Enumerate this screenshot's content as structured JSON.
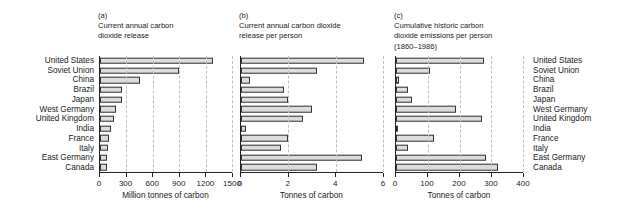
{
  "countries": [
    "United States",
    "Soviet Union",
    "China",
    "Brazil",
    "Japan",
    "West Germany",
    "United Kingdom",
    "India",
    "France",
    "Italy",
    "East Germany",
    "Canada"
  ],
  "labels_left_name": "country-labels-left",
  "labels_right_name": "country-labels-right",
  "panels": [
    {
      "tag": "(a)",
      "title": "Current annual carbon\ndioxide release",
      "axis_title": "Million tonnes of carbon",
      "ticks": [
        0,
        300,
        600,
        900,
        1200,
        1500
      ],
      "tick_labels": [
        "0",
        "300",
        "600",
        "900",
        "1200",
        "1500"
      ]
    },
    {
      "tag": "(b)",
      "title": "Current annual carbon dioxide\nrelease per person",
      "axis_title": "Tonnes of carbon",
      "ticks": [
        0,
        2,
        4,
        6
      ],
      "tick_labels": [
        "0",
        "2",
        "4",
        "6"
      ]
    },
    {
      "tag": "(c)",
      "title": "Cumulative historic carbon\ndioxide emissions per person\n(1860–1986)",
      "axis_title": "Tonnes of carbon",
      "ticks": [
        0,
        100,
        200,
        300,
        400
      ],
      "tick_labels": [
        "0",
        "100",
        "200",
        "300",
        "400"
      ]
    }
  ],
  "chart_data": [
    {
      "type": "bar",
      "orientation": "horizontal",
      "panel": "(a)",
      "title": "Current annual carbon dioxide release",
      "xlabel": "Million tonnes of carbon",
      "ylabel": "",
      "xlim": [
        0,
        1500
      ],
      "xticks": [
        0,
        300,
        600,
        900,
        1200,
        1500
      ],
      "grid": "vertical-dashed",
      "legend": "none",
      "categories": [
        "United States",
        "Soviet Union",
        "China",
        "Brazil",
        "Japan",
        "West Germany",
        "United Kingdom",
        "India",
        "France",
        "Italy",
        "East Germany",
        "Canada"
      ],
      "values": [
        1280,
        900,
        450,
        250,
        250,
        185,
        155,
        125,
        100,
        95,
        85,
        85
      ]
    },
    {
      "type": "bar",
      "orientation": "horizontal",
      "panel": "(b)",
      "title": "Current annual carbon dioxide release per person",
      "xlabel": "Tonnes of carbon",
      "ylabel": "",
      "xlim": [
        0,
        6
      ],
      "xticks": [
        0,
        2,
        4,
        6
      ],
      "grid": "vertical-dashed",
      "legend": "none",
      "categories": [
        "United States",
        "Soviet Union",
        "China",
        "Brazil",
        "Japan",
        "West Germany",
        "United Kingdom",
        "India",
        "France",
        "Italy",
        "East Germany",
        "Canada"
      ],
      "values": [
        5.2,
        3.2,
        0.4,
        1.8,
        2.0,
        3.0,
        2.6,
        0.2,
        2.0,
        1.7,
        5.1,
        3.2
      ]
    },
    {
      "type": "bar",
      "orientation": "horizontal",
      "panel": "(c)",
      "title": "Cumulative historic carbon dioxide emissions per person (1860–1986)",
      "xlabel": "Tonnes of carbon",
      "ylabel": "",
      "xlim": [
        0,
        400
      ],
      "xticks": [
        0,
        100,
        200,
        300,
        400
      ],
      "grid": "vertical-dashed",
      "legend": "none",
      "categories": [
        "United States",
        "Soviet Union",
        "China",
        "Brazil",
        "Japan",
        "West Germany",
        "United Kingdom",
        "India",
        "France",
        "Italy",
        "East Germany",
        "Canada"
      ],
      "values": [
        278,
        108,
        8,
        38,
        50,
        190,
        272,
        7,
        120,
        38,
        285,
        322
      ]
    }
  ],
  "style": {
    "bar_fill": "#dcdcdc",
    "bar_stroke": "#333333",
    "axis_color": "#222222",
    "grid_color": "#bfbfbf",
    "background": "#ffffff"
  }
}
